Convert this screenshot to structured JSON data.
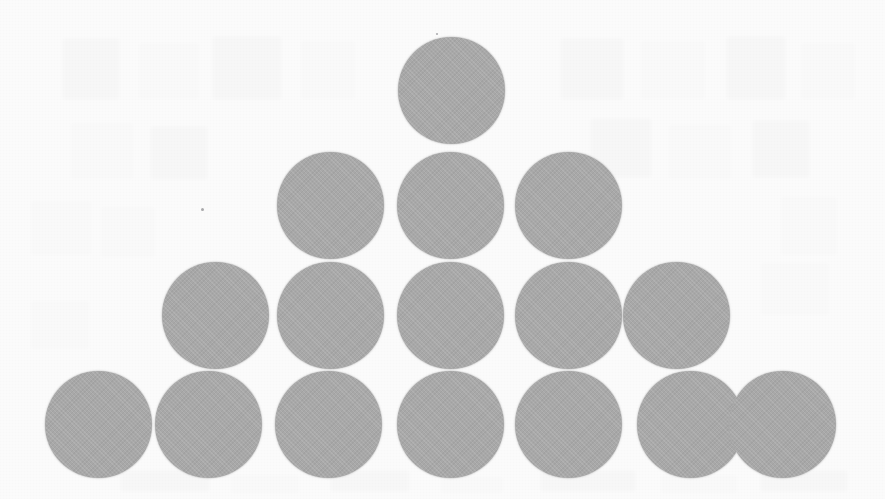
{
  "document": {
    "kind": "scanned-page",
    "title": "Triangular arrangement of sixteen shaded circles",
    "background_color": "#fafafa",
    "width": 885,
    "height": 499
  },
  "figure": {
    "name": "circle-pyramid",
    "shape_color": "#a8a8a8",
    "shape_type": "circle",
    "total_count": 16,
    "row_counts": [
      1,
      3,
      5,
      7
    ],
    "diameter": 107,
    "rows": [
      {
        "index": 1,
        "count": 1,
        "center_y": 90,
        "centers_x": [
          451
        ]
      },
      {
        "index": 2,
        "count": 3,
        "center_y": 205,
        "centers_x": [
          330,
          450,
          568
        ]
      },
      {
        "index": 3,
        "count": 5,
        "center_y": 315,
        "centers_x": [
          215,
          330,
          450,
          568,
          676
        ]
      },
      {
        "index": 4,
        "count": 7,
        "center_y": 424,
        "centers_x": [
          98,
          208,
          328,
          450,
          568,
          690,
          782
        ]
      }
    ]
  },
  "artifacts": {
    "ghost_text_blocks": [
      {
        "x": 62,
        "y": 38,
        "w": 58,
        "h": 62,
        "tone": "light"
      },
      {
        "x": 138,
        "y": 42,
        "w": 62,
        "h": 58,
        "tone": "faint"
      },
      {
        "x": 212,
        "y": 36,
        "w": 70,
        "h": 64,
        "tone": "light"
      },
      {
        "x": 300,
        "y": 40,
        "w": 56,
        "h": 60,
        "tone": "faint"
      },
      {
        "x": 560,
        "y": 38,
        "w": 64,
        "h": 62,
        "tone": "light"
      },
      {
        "x": 640,
        "y": 40,
        "w": 66,
        "h": 60,
        "tone": "faint"
      },
      {
        "x": 726,
        "y": 36,
        "w": 60,
        "h": 64,
        "tone": "light"
      },
      {
        "x": 800,
        "y": 42,
        "w": 56,
        "h": 58,
        "tone": "faint"
      },
      {
        "x": 70,
        "y": 122,
        "w": 64,
        "h": 58,
        "tone": "faint"
      },
      {
        "x": 150,
        "y": 126,
        "w": 58,
        "h": 54,
        "tone": "light"
      },
      {
        "x": 590,
        "y": 118,
        "w": 62,
        "h": 60,
        "tone": "light"
      },
      {
        "x": 668,
        "y": 124,
        "w": 64,
        "h": 56,
        "tone": "faint"
      },
      {
        "x": 752,
        "y": 120,
        "w": 58,
        "h": 58,
        "tone": "light"
      },
      {
        "x": 30,
        "y": 200,
        "w": 62,
        "h": 56,
        "tone": "faint"
      },
      {
        "x": 100,
        "y": 206,
        "w": 56,
        "h": 52,
        "tone": "faint"
      },
      {
        "x": 780,
        "y": 196,
        "w": 58,
        "h": 60,
        "tone": "faint"
      },
      {
        "x": 760,
        "y": 262,
        "w": 70,
        "h": 54,
        "tone": "faint"
      },
      {
        "x": 30,
        "y": 300,
        "w": 60,
        "h": 50,
        "tone": "faint"
      },
      {
        "x": 120,
        "y": 470,
        "w": 90,
        "h": 22,
        "tone": "light"
      },
      {
        "x": 230,
        "y": 474,
        "w": 70,
        "h": 20,
        "tone": "faint"
      },
      {
        "x": 330,
        "y": 470,
        "w": 80,
        "h": 22,
        "tone": "light"
      },
      {
        "x": 440,
        "y": 476,
        "w": 64,
        "h": 18,
        "tone": "faint"
      },
      {
        "x": 540,
        "y": 470,
        "w": 96,
        "h": 22,
        "tone": "light"
      },
      {
        "x": 660,
        "y": 474,
        "w": 78,
        "h": 20,
        "tone": "faint"
      },
      {
        "x": 760,
        "y": 470,
        "w": 88,
        "h": 22,
        "tone": "light"
      }
    ],
    "specks": [
      {
        "x": 201,
        "y": 208,
        "d": 3
      },
      {
        "x": 436,
        "y": 33,
        "d": 2
      },
      {
        "x": 556,
        "y": 336,
        "d": 2
      }
    ],
    "scanlines": [
      {
        "x": 216,
        "y": 262,
        "h": 106
      },
      {
        "x": 216,
        "y": 372,
        "h": 104
      }
    ]
  }
}
